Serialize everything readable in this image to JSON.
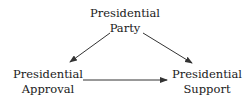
{
  "diagram": {
    "type": "causal-path-diagram",
    "nodes": [
      {
        "id": "party",
        "line1": "Presidential",
        "line2": "Party"
      },
      {
        "id": "approval",
        "line1": "Presidential",
        "line2": "Approval"
      },
      {
        "id": "support",
        "line1": "Presidential",
        "line2": "Support"
      }
    ],
    "edges": [
      {
        "from": "party",
        "to": "approval"
      },
      {
        "from": "party",
        "to": "support"
      },
      {
        "from": "approval",
        "to": "support"
      }
    ],
    "colors": {
      "text": "#1a1a1a",
      "arrow": "#333333",
      "background": "#ffffff"
    }
  }
}
